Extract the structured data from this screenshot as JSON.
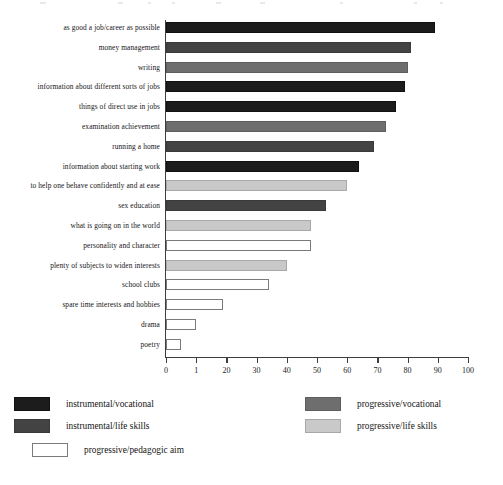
{
  "chart_data": {
    "type": "bar",
    "orientation": "horizontal",
    "title": "",
    "xlabel": "",
    "ylabel": "",
    "xlim": [
      0,
      100
    ],
    "grid": false,
    "legend_position": "bottom",
    "xticks": [
      "0",
      "1",
      "20",
      "30",
      "40",
      "50",
      "60",
      "70",
      "80",
      "90",
      "100"
    ],
    "xtick_values": [
      0,
      10,
      20,
      30,
      40,
      50,
      60,
      70,
      80,
      90,
      100
    ],
    "categories": [
      "as good a job/career as possible",
      "money management",
      "writing",
      "information about different sorts of jobs",
      "things of direct use in jobs",
      "examination achievement",
      "running a home",
      "information about starting work",
      "to help one behave confidently and at ease",
      "sex education",
      "what is going on in the world",
      "personality and character",
      "plenty of subjects to widen interests",
      "school clubs",
      "spare time interests and hobbies",
      "drama",
      "poetry"
    ],
    "values": [
      89,
      81,
      80,
      79,
      76,
      73,
      69,
      64,
      60,
      53,
      48,
      48,
      40,
      34,
      19,
      10,
      5
    ],
    "series_keys": [
      "instrumental/vocational",
      "instrumental/life skills",
      "progressive/vocational",
      "instrumental/vocational",
      "instrumental/vocational",
      "progressive/vocational",
      "instrumental/life skills",
      "instrumental/vocational",
      "progressive/life skills",
      "instrumental/life skills",
      "progressive/life skills",
      "progressive/pedagogic aim",
      "progressive/life skills",
      "progressive/pedagogic aim",
      "progressive/pedagogic aim",
      "progressive/pedagogic aim",
      "progressive/pedagogic aim"
    ],
    "legend": [
      {
        "label": "instrumental/vocational",
        "color": "#1c1c1c"
      },
      {
        "label": "instrumental/life skills",
        "color": "#434343"
      },
      {
        "label": "progressive/pedagogic aim",
        "color": "#ffffff"
      },
      {
        "label": "progressive/vocational",
        "color": "#6e6e6e"
      },
      {
        "label": "progressive/life skills",
        "color": "#c9c9c9"
      }
    ]
  }
}
